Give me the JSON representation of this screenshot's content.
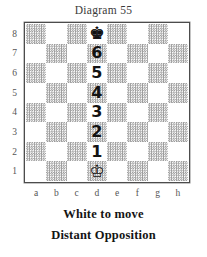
{
  "title": "Diagram 55",
  "board": {
    "light_color": "#ffffff",
    "dark_color": "#9a9a9a",
    "border_color": "#4c4c4c",
    "files": [
      "a",
      "b",
      "c",
      "d",
      "e",
      "f",
      "g",
      "h"
    ],
    "ranks": [
      "8",
      "7",
      "6",
      "5",
      "4",
      "3",
      "2",
      "1"
    ],
    "pieces": [
      {
        "square": "d8",
        "glyph": "♚",
        "name": "black-king",
        "color": "black",
        "type": "king"
      },
      {
        "square": "d1",
        "glyph": "♔",
        "name": "white-king",
        "color": "white",
        "type": "king"
      }
    ],
    "markers": [
      {
        "square": "d7",
        "label": "6"
      },
      {
        "square": "d6",
        "label": "5"
      },
      {
        "square": "d5",
        "label": "4"
      },
      {
        "square": "d4",
        "label": "3"
      },
      {
        "square": "d3",
        "label": "2"
      },
      {
        "square": "d2",
        "label": "1"
      }
    ]
  },
  "caption": {
    "line1": "White to move",
    "line2": "Distant Opposition"
  }
}
